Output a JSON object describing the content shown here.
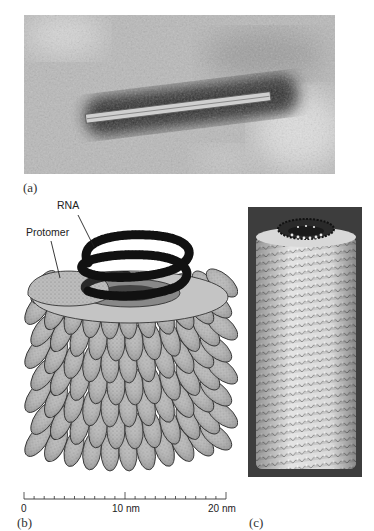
{
  "figure": {
    "panels": [
      {
        "id": "a",
        "label": "(a)",
        "description": "Electron micrograph of a rod-shaped virus particle on stained background"
      },
      {
        "id": "b",
        "label": "(b)",
        "description": "Schematic drawing of helical capsid with RNA strand and protomers",
        "annotations": [
          {
            "text": "RNA"
          },
          {
            "text": "Protomer"
          }
        ],
        "scale_bar": {
          "ticks": [
            "0",
            "10 nm",
            "20 nm"
          ],
          "minor_ticks_per_10nm": 10,
          "units": "nm",
          "range": [
            0,
            20
          ]
        }
      },
      {
        "id": "c",
        "label": "(c)",
        "description": "Computer model of helical capsid on dark background"
      }
    ],
    "colors": {
      "micrograph_bg": "#b7b7b7",
      "micrograph_dark": "#2a2a2a",
      "protomer_fill": "#bdbdbd",
      "protomer_stroke": "#333333",
      "rna": "#1a1a1a",
      "model_bg": "#3c3c3c",
      "model_fill": "#d9d9d9"
    }
  }
}
